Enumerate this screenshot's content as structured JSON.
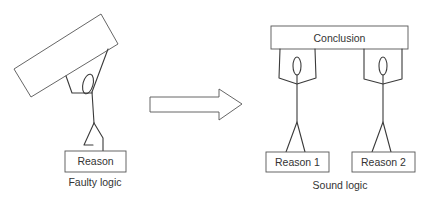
{
  "diagram": {
    "left_panel": {
      "caption": "Faulty logic",
      "reason_label": "Reason",
      "conclusion_label": ""
    },
    "arrow": {
      "direction": "right",
      "icon": "arrow-right-icon"
    },
    "right_panel": {
      "caption": "Sound logic",
      "conclusion_label": "Conclusion",
      "reasons": [
        {
          "label": "Reason 1"
        },
        {
          "label": "Reason 2"
        }
      ]
    },
    "colors": {
      "line": "#3a3a3a",
      "box_border": "#555555",
      "text": "#333333",
      "background": "#ffffff"
    }
  }
}
